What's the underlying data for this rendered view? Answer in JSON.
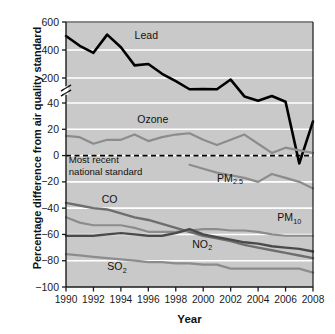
{
  "chart_data": {
    "type": "line",
    "title": "",
    "xlabel": "Year",
    "ylabel": "Percentage difference from air quality standard",
    "xlim": [
      1990,
      2008
    ],
    "ylim": [
      -100,
      600
    ],
    "axis_break": {
      "from": 40,
      "to": 200,
      "note": "y-axis broken between 40 and 200"
    },
    "grid": "horizontal white gridlines on gray plot background",
    "legend_position": "inline series labels",
    "plot_background": "#c9c9c9",
    "xticks": [
      1990,
      1992,
      1994,
      1996,
      1998,
      2000,
      2002,
      2004,
      2006,
      2008
    ],
    "xtick_labels": [
      "1990",
      "1992",
      "1994",
      "1996",
      "1998",
      "2000",
      "2002",
      "2004",
      "2006",
      "2008"
    ],
    "yticks": [
      -100,
      -80,
      -60,
      -40,
      -20,
      0,
      20,
      40,
      200,
      400,
      600
    ],
    "ytick_labels": [
      "−100",
      "−80",
      "−60",
      "−40",
      "−20",
      "0",
      "20",
      "40",
      "200",
      "400",
      "600"
    ],
    "annotations": [
      {
        "text": "Most recent national standard",
        "lines": [
          "Most recent",
          "national standard"
        ],
        "x": 1990.2,
        "y": -6,
        "style": "dashed reference line at y = 0"
      }
    ],
    "reference_line": {
      "y": 0,
      "style": "dashed",
      "color": "#000000"
    },
    "x": [
      1990,
      1991,
      1992,
      1993,
      1994,
      1995,
      1996,
      1997,
      1998,
      1999,
      2000,
      2001,
      2002,
      2003,
      2004,
      2005,
      2006,
      2007,
      2008
    ],
    "series": [
      {
        "name": "Lead",
        "label": "Lead",
        "color": "#000000",
        "width": 2.6,
        "values": [
          500,
          430,
          380,
          510,
          420,
          290,
          300,
          230,
          180,
          128,
          130,
          128,
          190,
          82,
          55,
          85,
          48,
          -6,
          26
        ]
      },
      {
        "name": "Ozone",
        "label": "Ozone",
        "color": "#8c8c8c",
        "width": 2.2,
        "values": [
          15,
          14,
          9,
          12,
          12,
          16,
          11,
          14,
          16,
          17,
          12,
          8,
          12,
          16,
          9,
          2,
          6,
          4,
          2
        ]
      },
      {
        "name": "PM2.5",
        "label": "PM",
        "label_sub": "2.5",
        "color": "#8c8c8c",
        "width": 2.2,
        "start_year": 1999,
        "values": [
          null,
          null,
          null,
          null,
          null,
          null,
          null,
          null,
          null,
          -7,
          -10,
          -13,
          -15,
          -17,
          -20,
          -14,
          -17,
          -20,
          -25
        ]
      },
      {
        "name": "CO",
        "label": "CO",
        "color": "#6e6e6e",
        "width": 2.4,
        "values": [
          -36,
          -38,
          -40,
          -41,
          -44,
          -47,
          -49,
          -52,
          -55,
          -58,
          -61,
          -63,
          -65,
          -68,
          -70,
          -72,
          -74,
          -76,
          -78
        ]
      },
      {
        "name": "PM10",
        "label": "PM",
        "label_sub": "10",
        "color": "#8c8c8c",
        "width": 2.2,
        "values": [
          -47,
          -51,
          -53,
          -53,
          -53,
          -55,
          -58,
          -58,
          -58,
          -57,
          -56,
          -56,
          -57,
          -57,
          -58,
          -60,
          -61,
          -61,
          -61
        ]
      },
      {
        "name": "NO2",
        "label": "NO",
        "label_sub": "2",
        "color": "#4a4a4a",
        "width": 2.4,
        "values": [
          -61,
          -61,
          -61,
          -60,
          -59,
          -60,
          -61,
          -61,
          -59,
          -56,
          -60,
          -62,
          -64,
          -66,
          -67,
          -69,
          -70,
          -71,
          -73
        ]
      },
      {
        "name": "SO2",
        "label": "SO",
        "label_sub": "2",
        "color": "#8c8c8c",
        "width": 2.3,
        "values": [
          -75,
          -76,
          -77,
          -78,
          -79,
          -80,
          -81,
          -81,
          -82,
          -82,
          -83,
          -83,
          -86,
          -86,
          -86,
          -86,
          -86,
          -86,
          -89
        ]
      }
    ],
    "series_label_positions": [
      {
        "name": "Lead",
        "x": 1995.0,
        "y": 480
      },
      {
        "name": "Ozone",
        "x": 1995.2,
        "y": 25
      },
      {
        "name": "PM2.5",
        "x": 2001.0,
        "y": -20
      },
      {
        "name": "CO",
        "x": 1992.6,
        "y": -36
      },
      {
        "name": "PM10",
        "x": 2005.4,
        "y": -50
      },
      {
        "name": "NO2",
        "x": 1999.2,
        "y": -70
      },
      {
        "name": "SO2",
        "x": 1993.0,
        "y": -87
      }
    ]
  }
}
